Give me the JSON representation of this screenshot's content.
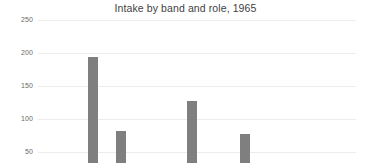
{
  "chart_data": {
    "type": "bar",
    "title": "Intake by band and role, 1965",
    "xlabel": "",
    "ylabel": "",
    "categories": [
      "",
      "",
      "",
      ""
    ],
    "values": [
      192,
      81,
      127,
      77
    ],
    "ylim": [
      0,
      250
    ],
    "yticks": [
      250,
      200,
      150,
      100,
      50
    ],
    "ytick_labels": [
      "250",
      "200",
      "150",
      "100",
      "50"
    ],
    "grid": true,
    "legend": false,
    "bar_color": "#7f7f7f",
    "grid_color": "#ececec",
    "title_color": "#3f3f3f",
    "tick_color": "#6a6a6a",
    "background": "#ffffff",
    "note_cropped": "chart is cropped at the bottom; x-axis category labels are not visible"
  },
  "layout": {
    "plot_left": 38,
    "plot_right": 356,
    "value_per_pixel": 1.515,
    "baseline_y": 185,
    "y_at_50": 152,
    "bars_px": [
      {
        "x": 88,
        "width": 10,
        "top": 57
      },
      {
        "x": 116,
        "width": 10,
        "top": 131
      },
      {
        "x": 187,
        "width": 10,
        "top": 101
      },
      {
        "x": 240,
        "width": 10,
        "top": 134
      }
    ],
    "gridlines_y": [
      20,
      53,
      86,
      119,
      152
    ]
  }
}
